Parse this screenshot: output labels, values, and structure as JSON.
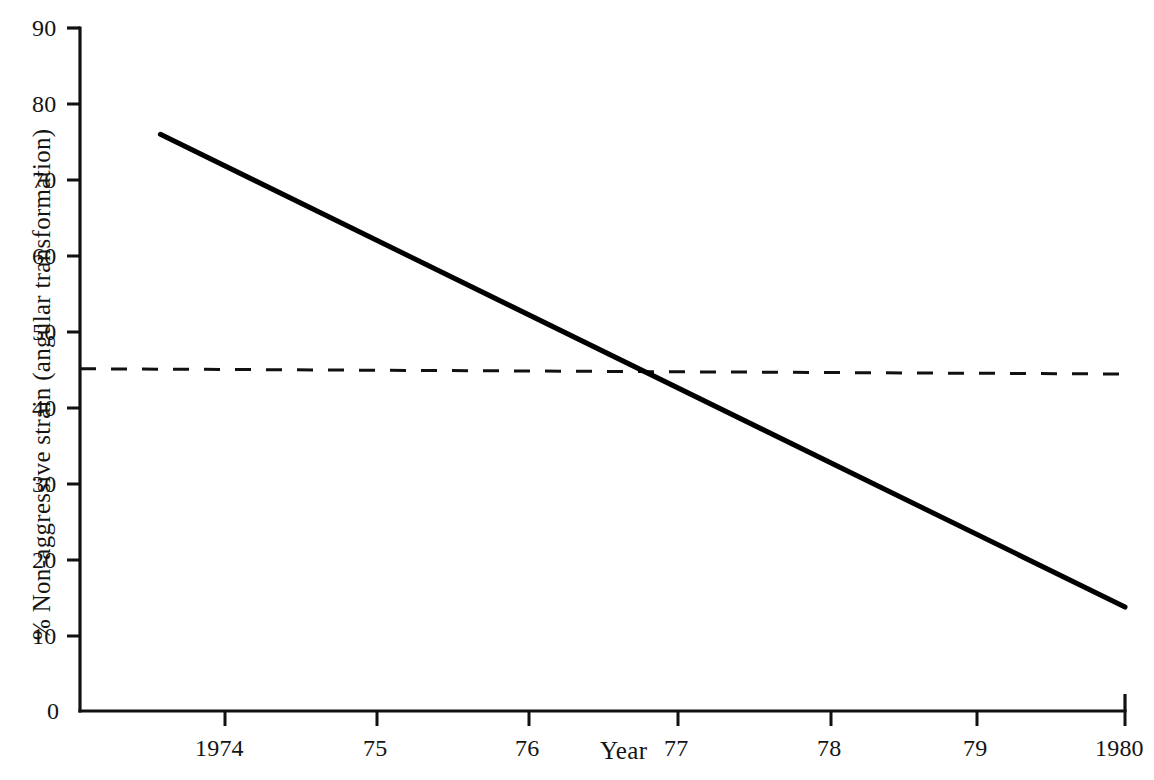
{
  "chart_data": {
    "type": "line",
    "title": "",
    "subtitle": "",
    "xlabel": "Year",
    "ylabel": "% Non-aggressive strain (angular transformation)",
    "xlim": [
      1973.5,
      1980.0
    ],
    "ylim": [
      0,
      90
    ],
    "x_tick_labels": [
      "1974",
      "75",
      "76",
      "77",
      "78",
      "79",
      "1980"
    ],
    "x_tick_values": [
      1974,
      1975,
      1976,
      1977,
      1978,
      1979,
      1980
    ],
    "y_tick_labels": [
      "0",
      "10",
      "20",
      "30",
      "40",
      "50",
      "60",
      "70",
      "80",
      "90"
    ],
    "y_tick_values": [
      0,
      10,
      20,
      30,
      40,
      50,
      60,
      70,
      80,
      90
    ],
    "grid": false,
    "legend": "none",
    "series": [
      {
        "name": "Non-aggressive strain trend",
        "style": "solid",
        "color": "#000000",
        "width": 5,
        "x": [
          1974,
          1980
        ],
        "values": [
          76,
          13.7
        ]
      },
      {
        "name": "Reference level",
        "style": "dashed",
        "color": "#111111",
        "width": 3,
        "x": [
          1973.5,
          1980
        ],
        "values": [
          45.1,
          44.4
        ]
      }
    ],
    "annotations": [
      {
        "name": "crossing-point",
        "x": 1977,
        "y": 44.8,
        "note": "solid trend line crosses dashed reference level near 1977"
      }
    ]
  },
  "axes": {
    "y_axis_name": "y-axis",
    "x_axis_name": "x-axis",
    "axis_color": "#111111"
  }
}
